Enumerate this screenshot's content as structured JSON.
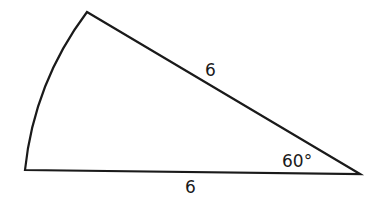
{
  "figure": {
    "type": "sector",
    "labels": {
      "upper_radius": "6",
      "lower_radius": "6",
      "central_angle": "60°"
    },
    "colors": {
      "stroke": "#1a1a1a",
      "background": "#ffffff"
    }
  }
}
